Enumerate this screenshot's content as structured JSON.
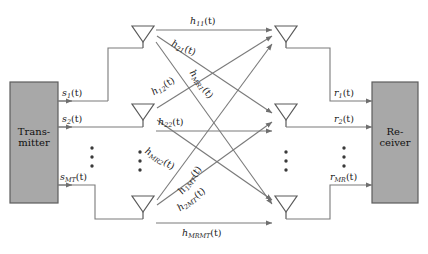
{
  "figure": {
    "type": "mimo-channel-block-diagram",
    "colors": {
      "block_fill": "#a8a8a8",
      "block_stroke": "#555555",
      "line": "#7a7a7a",
      "text": "#1a1a1a",
      "background": "#ffffff"
    }
  },
  "blocks": {
    "transmitter": {
      "line1": "Trans-",
      "line2": "mitter"
    },
    "receiver": {
      "line1": "Re-",
      "line2": "ceiver"
    }
  },
  "transmit_signals": [
    {
      "base": "s",
      "sub": "1",
      "suffix": "(t)",
      "text": "s1(t)"
    },
    {
      "base": "s",
      "sub": "2",
      "suffix": "(t)",
      "text": "s2(t)"
    },
    {
      "base": "s",
      "sub": "MT",
      "suffix": "(t)",
      "text": "sMT(t)"
    }
  ],
  "receive_signals": [
    {
      "base": "r",
      "sub": "1",
      "suffix": "(t)",
      "text": "r1(t)"
    },
    {
      "base": "r",
      "sub": "2",
      "suffix": "(t)",
      "text": "r2(t)"
    },
    {
      "base": "r",
      "sub": "MR",
      "suffix": "(t)",
      "text": "rMR(t)"
    }
  ],
  "channels": [
    {
      "id": "h11",
      "base": "h",
      "sub": "11",
      "suffix": "(t)"
    },
    {
      "id": "h21",
      "base": "h",
      "sub": "21",
      "suffix": "(t)"
    },
    {
      "id": "h12",
      "base": "h",
      "sub": "12",
      "suffix": "(t)"
    },
    {
      "id": "hMR1",
      "base": "h",
      "sub": "MR1",
      "suffix": "(t)"
    },
    {
      "id": "h22",
      "base": "h",
      "sub": "22",
      "suffix": "(t)"
    },
    {
      "id": "hMR2",
      "base": "h",
      "sub": "MR2",
      "suffix": "(t)"
    },
    {
      "id": "h1MT",
      "base": "h",
      "sub": "1MT",
      "suffix": "(t)"
    },
    {
      "id": "h2MT",
      "base": "h",
      "sub": "2MT",
      "suffix": "(t)"
    },
    {
      "id": "hMRMT",
      "base": "h",
      "sub": "MRMT",
      "suffix": "(t)"
    }
  ],
  "antennas": {
    "transmit_count_label": "MT",
    "receive_count_label": "MR",
    "vertical_ellipsis": "⋮"
  }
}
